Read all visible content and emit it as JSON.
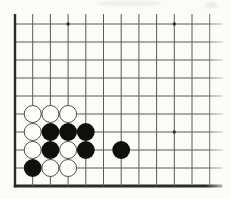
{
  "diagram": {
    "kind": "go-board-corner-diagram",
    "paper_color": "#fbfbf8",
    "line_color": "#5a5a58",
    "edge_color": "#2a2a28",
    "star_point_color": "#333331",
    "black_stone_color": "#0f0f0d",
    "white_stone_fill": "#fdfdfb",
    "white_stone_outline": "#3e3e3c",
    "grid": {
      "columns": 12,
      "rows": 10,
      "origin_x": 15,
      "origin_y": 24,
      "col_spacing": 17.7,
      "row_spacing": 18,
      "vertical_top_y": 14,
      "horizontal_right_x": 222.5,
      "thin_line_width": 1,
      "left_edge_width": 2.4,
      "bottom_edge_width": 3,
      "star_point_radius": 1.7,
      "stone_radius_white": 8.5,
      "stone_radius_black": 8.9
    },
    "star_points": [
      {
        "col": 4,
        "row": 1
      },
      {
        "col": 10,
        "row": 1
      },
      {
        "col": 10,
        "row": 7
      }
    ],
    "stones": [
      {
        "col": 2,
        "row": 6,
        "color": "white"
      },
      {
        "col": 3,
        "row": 6,
        "color": "white"
      },
      {
        "col": 4,
        "row": 6,
        "color": "white"
      },
      {
        "col": 2,
        "row": 7,
        "color": "white"
      },
      {
        "col": 3,
        "row": 7,
        "color": "black"
      },
      {
        "col": 4,
        "row": 7,
        "color": "black"
      },
      {
        "col": 5,
        "row": 7,
        "color": "black"
      },
      {
        "col": 2,
        "row": 8,
        "color": "white"
      },
      {
        "col": 3,
        "row": 8,
        "color": "black"
      },
      {
        "col": 4,
        "row": 8,
        "color": "white"
      },
      {
        "col": 5,
        "row": 8,
        "color": "black"
      },
      {
        "col": 7,
        "row": 8,
        "color": "black"
      },
      {
        "col": 2,
        "row": 9,
        "color": "black"
      },
      {
        "col": 3,
        "row": 9,
        "color": "white"
      },
      {
        "col": 4,
        "row": 9,
        "color": "white"
      }
    ],
    "counts": {
      "white_stones": 8,
      "black_stones": 7
    }
  }
}
